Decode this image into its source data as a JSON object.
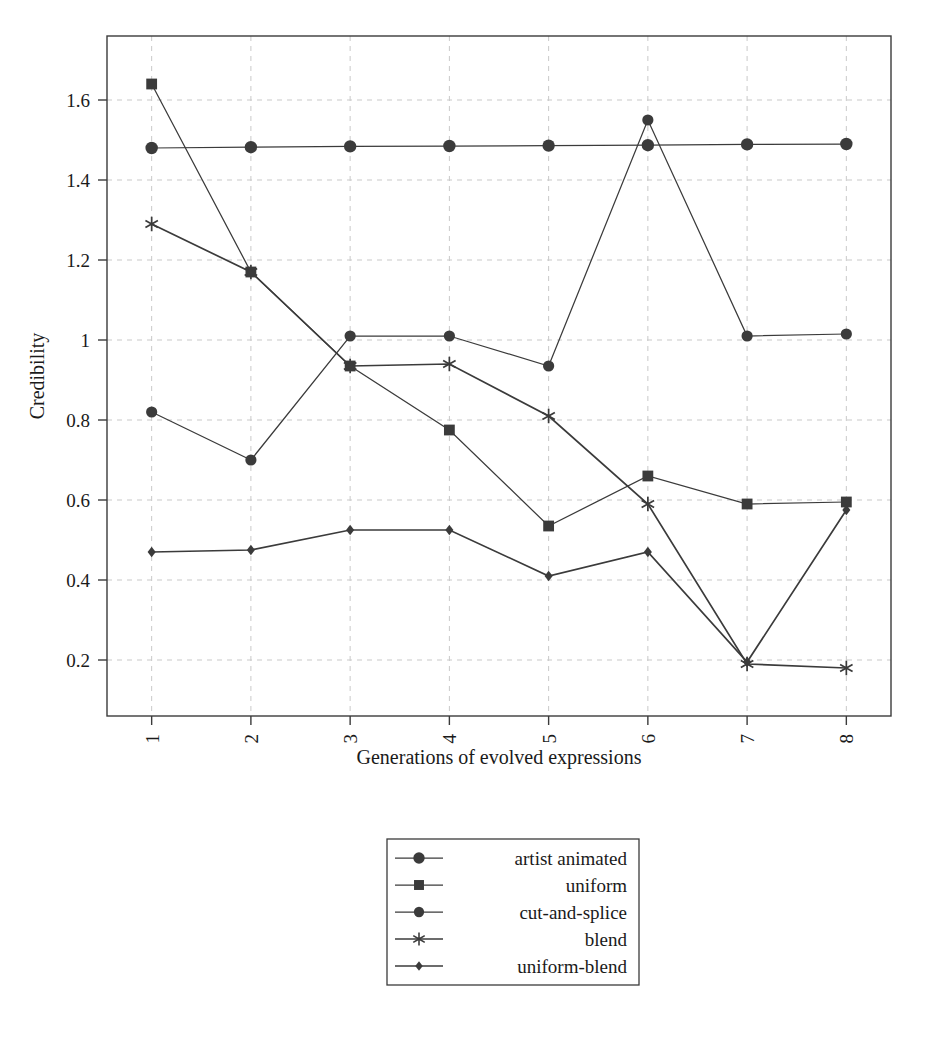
{
  "chart_data": {
    "type": "line",
    "title": "",
    "xlabel": "Generations of evolved expressions",
    "ylabel": "Credibility",
    "categories": [
      "1",
      "2",
      "3",
      "4",
      "5",
      "6",
      "7",
      "8"
    ],
    "x": [
      1,
      2,
      3,
      4,
      5,
      6,
      7,
      8
    ],
    "xlim": [
      0.55,
      8.45
    ],
    "ylim": [
      0.06,
      1.76
    ],
    "yticks": [
      "0.2",
      "0.4",
      "0.6",
      "0.8",
      "1",
      "1.2",
      "1.4",
      "1.6"
    ],
    "ytick_values": [
      0.2,
      0.4,
      0.6,
      0.8,
      1.0,
      1.2,
      1.4,
      1.6
    ],
    "xticks": [
      "1",
      "2",
      "3",
      "4",
      "5",
      "6",
      "7",
      "8"
    ],
    "grid": true,
    "legend_position": "below-center",
    "series": [
      {
        "name": "artist animated",
        "marker": "circle-large",
        "values": [
          1.48,
          1.482,
          1.484,
          1.485,
          1.486,
          1.487,
          1.489,
          1.49
        ]
      },
      {
        "name": "uniform",
        "marker": "square",
        "values": [
          1.64,
          1.17,
          0.935,
          0.775,
          0.535,
          0.66,
          0.59,
          0.595
        ]
      },
      {
        "name": "cut-and-splice",
        "marker": "circle",
        "values": [
          0.82,
          0.7,
          1.01,
          1.01,
          0.935,
          1.55,
          1.01,
          1.015
        ]
      },
      {
        "name": "blend",
        "marker": "star",
        "values": [
          1.29,
          1.17,
          0.935,
          0.94,
          0.81,
          0.59,
          0.19,
          0.18
        ]
      },
      {
        "name": "uniform-blend",
        "marker": "diamond",
        "values": [
          0.47,
          0.475,
          0.525,
          0.525,
          0.41,
          0.47,
          0.195,
          0.575
        ]
      }
    ]
  },
  "legend": {
    "entries": [
      {
        "label": "artist animated",
        "marker": "circle-large"
      },
      {
        "label": "uniform",
        "marker": "square"
      },
      {
        "label": "cut-and-splice",
        "marker": "circle"
      },
      {
        "label": "blend",
        "marker": "star"
      },
      {
        "label": "uniform-blend",
        "marker": "diamond"
      }
    ]
  },
  "colors": {
    "line": "#3b3b3b",
    "grid": "#c9c9c9",
    "text": "#1a1a1a",
    "background": "#ffffff"
  }
}
